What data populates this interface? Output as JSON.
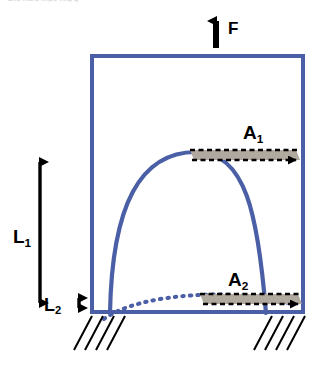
{
  "figure": {
    "caption_clipped": "and more impo      ring                g",
    "colors": {
      "member_blue": "#4a5fa5",
      "area_fill_gray": "#b0a99f",
      "outline_black": "#000000",
      "background": "#ffffff"
    },
    "labels": {
      "force": {
        "name": "F",
        "text": "F"
      },
      "area_top": {
        "name": "A",
        "subscript": "1",
        "text": "A1"
      },
      "area_bottom": {
        "name": "A",
        "subscript": "2",
        "text": "A2"
      },
      "length_long": {
        "name": "L",
        "subscript": "1",
        "text": "L1"
      },
      "length_short": {
        "name": "L",
        "subscript": "2",
        "text": "L2"
      }
    },
    "elements": {
      "frame": "rectangular-blue-frame",
      "arch_solid": "solid-blue-dome-curve",
      "arch_dashed": "dotted-blue-shallow-arc",
      "band_top": "hatched-gray-area-band-A1",
      "band_bottom": "hatched-gray-area-band-A2",
      "supports": "ground-hatching-both-sides",
      "force_arrow": "upward-force-arrow",
      "dim_arrow_long": "double-headed-vertical-dimension-arrow",
      "dim_arrow_short": "double-headed-vertical-dimension-arrow"
    }
  }
}
